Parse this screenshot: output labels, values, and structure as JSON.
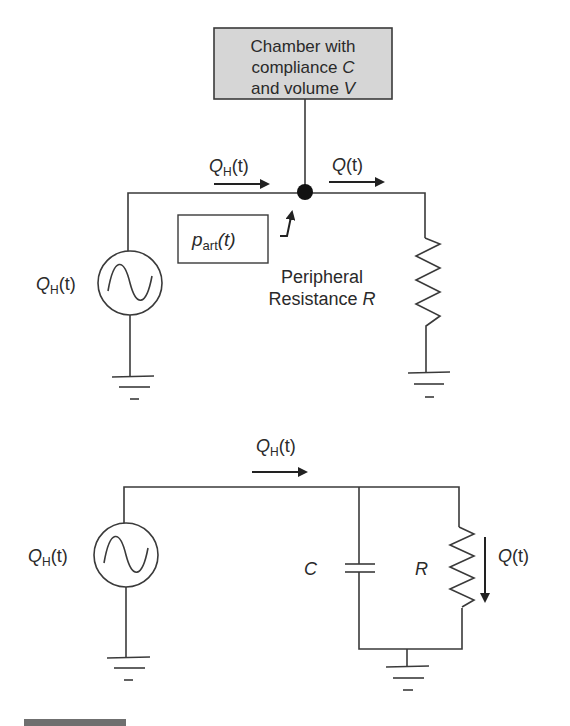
{
  "colors": {
    "line": "#3a3a3a",
    "chamber_fill": "#d6d6d6",
    "text": "#2a2a2a",
    "footer_bar": "#6f6f6f"
  },
  "top_circuit": {
    "chamber": {
      "line1": "Chamber with",
      "line2_prefix": "compliance ",
      "line2_var": "C",
      "line3_prefix": "and volume ",
      "line3_var": "V"
    },
    "inflow_label": {
      "var": "Q",
      "sub": "H",
      "arg": "(t)"
    },
    "outflow_label": {
      "var": "Q",
      "arg": "(t)"
    },
    "pressure_label": {
      "var": "p",
      "sub": "art",
      "arg": "(t)"
    },
    "source_label": {
      "var": "Q",
      "sub": "H",
      "arg": "(t)"
    },
    "resistance_label": {
      "line1": "Peripheral",
      "line2_prefix": "Resistance ",
      "line2_var": "R"
    }
  },
  "bottom_circuit": {
    "inflow_label": {
      "var": "Q",
      "sub": "H",
      "arg": "(t)"
    },
    "source_label": {
      "var": "Q",
      "sub": "H",
      "arg": "(t)"
    },
    "capacitor_label": "C",
    "resistor_label": "R",
    "resistor_flow_label": {
      "var": "Q",
      "arg": "(t)"
    }
  }
}
